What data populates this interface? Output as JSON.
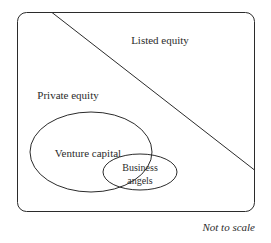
{
  "figure": {
    "type": "venn-diagram",
    "background_color": "#ffffff",
    "stroke_color": "#2b2b2b",
    "text_color": "#2b2b2b"
  },
  "regions": {
    "listed_equity": {
      "label": "Listed equity",
      "shape": "triangle-upper-right-of-diagonal"
    },
    "private_equity": {
      "label": "Private equity",
      "shape": "triangle-lower-left-of-diagonal"
    },
    "venture_capital": {
      "label": "Venture capital",
      "shape": "ellipse"
    },
    "business_angels": {
      "label_line1": "Business",
      "label_line2": "angels",
      "shape": "ellipse"
    }
  },
  "footnote": {
    "text": "Not to scale"
  }
}
